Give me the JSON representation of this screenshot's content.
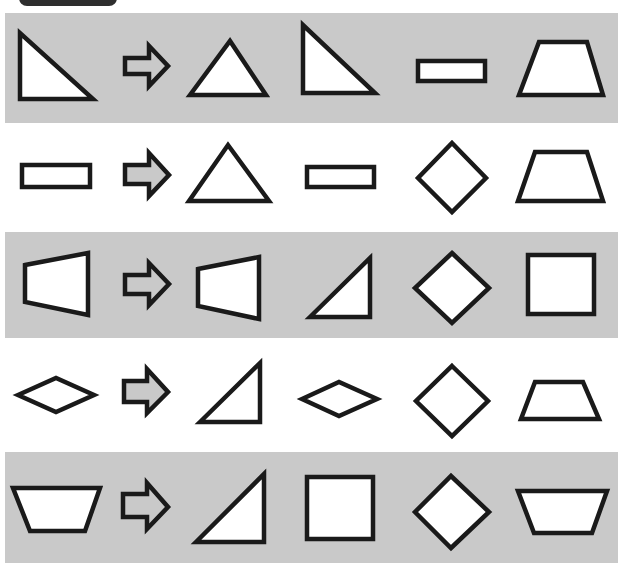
{
  "header_tab": {
    "label": ""
  },
  "colors": {
    "band_gray": "#c9c9c9",
    "band_white": "#ffffff",
    "stroke": "#1a1a1a",
    "arrow_fill_gray_row": "#c9c9c9",
    "arrow_fill_white_row": "#c9c9c9"
  },
  "rows": [
    {
      "band": "gray",
      "top": 13,
      "height": 110,
      "question": "right-triangle-left",
      "answer": "isosceles-triangle",
      "options": [
        "right-triangle-left",
        "rectangle-flat",
        "trapezoid-up"
      ]
    },
    {
      "band": "white",
      "top": 123,
      "height": 109,
      "question": "rectangle-flat",
      "answer": "isosceles-triangle",
      "options": [
        "rectangle-flat",
        "rhombus-tall",
        "trapezoid-up"
      ]
    },
    {
      "band": "gray",
      "top": 232,
      "height": 106,
      "question": "trapezoid-left",
      "answer": "trapezoid-left",
      "options": [
        "right-triangle-right",
        "diamond",
        "square"
      ]
    },
    {
      "band": "white",
      "top": 338,
      "height": 114,
      "question": "rhombus-wide",
      "answer": "right-triangle-right",
      "options": [
        "rhombus-wide",
        "diamond",
        "trapezoid-up-small"
      ]
    },
    {
      "band": "gray",
      "top": 452,
      "height": 111,
      "question": "trapezoid-down",
      "answer": "right-triangle-right",
      "options": [
        "square",
        "diamond",
        "trapezoid-down"
      ]
    }
  ]
}
